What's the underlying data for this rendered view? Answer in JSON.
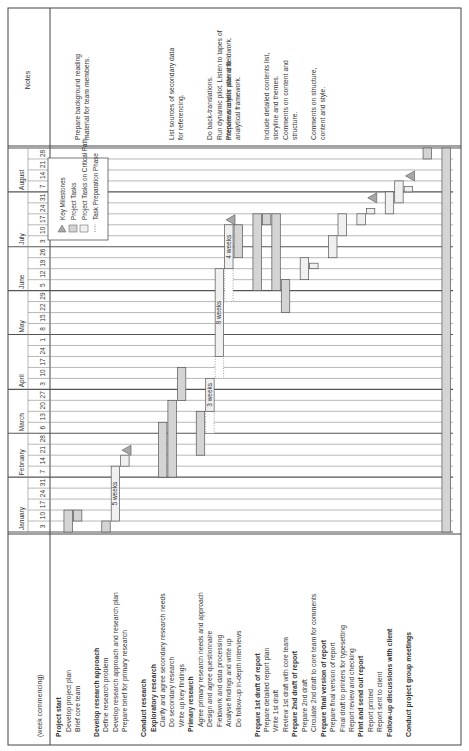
{
  "header": {
    "week_label": "(week commencing)",
    "notes_label": "Notes"
  },
  "months": [
    {
      "name": "January",
      "weeks": [
        "3",
        "10",
        "17",
        "24",
        "31"
      ]
    },
    {
      "name": "February",
      "weeks": [
        "7",
        "14",
        "21",
        "28"
      ]
    },
    {
      "name": "March",
      "weeks": [
        "6",
        "13",
        "20",
        "27"
      ]
    },
    {
      "name": "April",
      "weeks": [
        "3",
        "10",
        "17",
        "24",
        "1"
      ]
    },
    {
      "name": "May",
      "weeks": [
        "8",
        "15",
        "22",
        "29"
      ]
    },
    {
      "name": "June",
      "weeks": [
        "5",
        "12",
        "19",
        "26"
      ]
    },
    {
      "name": "July",
      "weeks": [
        "3",
        "10",
        "17",
        "24",
        "31"
      ]
    },
    {
      "name": "August",
      "weeks": [
        "7",
        "14",
        "21",
        "28"
      ]
    }
  ],
  "legend": {
    "items": [
      {
        "icon": "milestone-triangle",
        "label": "Key Milestones"
      },
      {
        "icon": "task-bar",
        "label": "Project Tasks"
      },
      {
        "icon": "critical-path-bar",
        "label": "Project Tasks on Critical Path"
      },
      {
        "icon": "dotted-bar",
        "label": "Task Preparation Phase"
      }
    ]
  },
  "colors": {
    "task": "#d4d4d4",
    "critical": "#f0f0f0",
    "milestone": "#a8a8a8",
    "grid": "#555555",
    "border": "#444444"
  },
  "rows": [
    {
      "label": "Project start",
      "bold": true,
      "indent": 0
    },
    {
      "label": "Develop project plan",
      "bold": false,
      "indent": 1
    },
    {
      "label": "Brief core team",
      "bold": false,
      "indent": 1
    },
    {
      "label": "",
      "bold": false,
      "indent": 0,
      "spacer": true
    },
    {
      "label": "Develop research approach",
      "bold": true,
      "indent": 0
    },
    {
      "label": "Define research problem",
      "bold": false,
      "indent": 1
    },
    {
      "label": "Develop research approach and research plan",
      "bold": false,
      "indent": 1
    },
    {
      "label": "Prepare brief for primary research",
      "bold": false,
      "indent": 1
    },
    {
      "label": "",
      "bold": false,
      "indent": 0,
      "spacer": true
    },
    {
      "label": "Conduct research",
      "bold": true,
      "indent": 0
    },
    {
      "label": "Exploratory research",
      "bold": true,
      "indent": 1
    },
    {
      "label": "Clarify and agree secondary research needs",
      "bold": false,
      "indent": 2
    },
    {
      "label": "Do secondary research",
      "bold": false,
      "indent": 2
    },
    {
      "label": "Write up key findings",
      "bold": false,
      "indent": 2
    },
    {
      "label": "Primary research",
      "bold": true,
      "indent": 1
    },
    {
      "label": "Agree primary research needs and approach",
      "bold": false,
      "indent": 2
    },
    {
      "label": "Design and agree questionnaire",
      "bold": false,
      "indent": 2
    },
    {
      "label": "Fieldwork and data processing",
      "bold": false,
      "indent": 2
    },
    {
      "label": "Analyse findings and write up",
      "bold": false,
      "indent": 2
    },
    {
      "label": "Do follow-up in-depth interviews",
      "bold": false,
      "indent": 2
    },
    {
      "label": "",
      "bold": false,
      "indent": 0,
      "spacer": true
    },
    {
      "label": "Prepare 1st draft of report",
      "bold": true,
      "indent": 0
    },
    {
      "label": "Prepare detailed report plan",
      "bold": false,
      "indent": 1
    },
    {
      "label": "Write 1st draft",
      "bold": false,
      "indent": 1
    },
    {
      "label": "Review 1st draft with core team",
      "bold": false,
      "indent": 1
    },
    {
      "label": "Prepare 2nd draft of report",
      "bold": true,
      "indent": 0
    },
    {
      "label": "Prepare 2nd draft",
      "bold": false,
      "indent": 1
    },
    {
      "label": "Circulate 2nd draft to core team for comments",
      "bold": false,
      "indent": 1
    },
    {
      "label": "Prepare final version of report",
      "bold": true,
      "indent": 0
    },
    {
      "label": "Prepare final version of report",
      "bold": false,
      "indent": 1
    },
    {
      "label": "Final draft to printers for typesetting",
      "bold": false,
      "indent": 1
    },
    {
      "label": "Report review and checking",
      "bold": false,
      "indent": 1
    },
    {
      "label": "Print and send out report",
      "bold": true,
      "indent": 0
    },
    {
      "label": "Report printed",
      "bold": false,
      "indent": 1
    },
    {
      "label": "Report sent to client",
      "bold": false,
      "indent": 1
    },
    {
      "label": "Follow-up discussions with client",
      "bold": true,
      "indent": 0
    },
    {
      "label": "",
      "bold": false,
      "indent": 0,
      "spacer": true
    },
    {
      "label": "Conduct project group meetings",
      "bold": true,
      "indent": 0
    }
  ],
  "notes": [
    {
      "row": 2,
      "lines": [
        "Prepare background reading",
        "material for team members."
      ]
    },
    {
      "row": 12,
      "lines": [
        "List sources of secondary data",
        "for referencing."
      ]
    },
    {
      "row": 16,
      "lines": [
        "Do back-translations."
      ]
    },
    {
      "row": 17,
      "lines": [
        "Run dynamic pilot. Listen to tapes of",
        "interviews and/or attend fieldwork."
      ]
    },
    {
      "row": 18,
      "lines": [
        "Prepare analysis plan and",
        "analytical framework."
      ]
    },
    {
      "row": 22,
      "lines": [
        "Include detailed contents list,",
        "storyline and themes."
      ]
    },
    {
      "row": 24,
      "lines": [
        "Comments on content and",
        "structure."
      ]
    },
    {
      "row": 27,
      "lines": [
        "Comments on structure,",
        "content and style."
      ]
    }
  ],
  "bars": [
    {
      "row": 1,
      "start": 0,
      "end": 2,
      "type": "task"
    },
    {
      "row": 2,
      "start": 1,
      "end": 2,
      "type": "task"
    },
    {
      "row": 5,
      "start": 0,
      "end": 1,
      "type": "task"
    },
    {
      "row": 6,
      "start": 1,
      "end": 6,
      "type": "critical",
      "label": "5 weeks"
    },
    {
      "row": 7,
      "start": 6,
      "end": 7,
      "type": "critical"
    },
    {
      "row": 11,
      "start": 5,
      "end": 10,
      "type": "task"
    },
    {
      "row": 12,
      "start": 5,
      "end": 12,
      "type": "task"
    },
    {
      "row": 13,
      "start": 12,
      "end": 15,
      "type": "task"
    },
    {
      "row": 15,
      "start": 7,
      "end": 11,
      "type": "task"
    },
    {
      "row": 16,
      "start": 9,
      "end": 11,
      "type": "prep"
    },
    {
      "row": 16,
      "start": 11,
      "end": 14,
      "type": "critical",
      "label": "3 weeks"
    },
    {
      "row": 17,
      "start": 14,
      "end": 16,
      "type": "prep"
    },
    {
      "row": 17,
      "start": 16,
      "end": 24,
      "type": "critical",
      "label": "8 weeks"
    },
    {
      "row": 18,
      "start": 21,
      "end": 24,
      "type": "prep"
    },
    {
      "row": 18,
      "start": 24,
      "end": 28,
      "type": "critical",
      "label": "4 weeks"
    },
    {
      "row": 19,
      "start": 25,
      "end": 28,
      "type": "task"
    },
    {
      "row": 21,
      "start": 22,
      "end": 29,
      "type": "task"
    },
    {
      "row": 22,
      "start": 28,
      "end": 29,
      "type": "task"
    },
    {
      "row": 23,
      "start": 22,
      "end": 29,
      "type": "task"
    },
    {
      "row": 24,
      "start": 20,
      "end": 23,
      "type": "task"
    },
    {
      "row": 26,
      "start": 23,
      "end": 25,
      "type": "critical"
    },
    {
      "row": 27,
      "start": 24,
      "end": 24.5,
      "type": "critical"
    },
    {
      "row": 29,
      "start": 25,
      "end": 27,
      "type": "critical"
    },
    {
      "row": 30,
      "start": 27,
      "end": 29,
      "type": "critical"
    },
    {
      "row": 32,
      "start": 28,
      "end": 29,
      "type": "critical"
    },
    {
      "row": 33,
      "start": 29,
      "end": 29.5,
      "type": "critical"
    },
    {
      "row": 35,
      "start": 29,
      "end": 31,
      "type": "critical"
    },
    {
      "row": 36,
      "start": 30,
      "end": 32,
      "type": "critical"
    },
    {
      "row": 37,
      "start": 31,
      "end": 31.5,
      "type": "critical"
    },
    {
      "row": 39,
      "start": 34,
      "end": 35,
      "type": "task"
    },
    {
      "row": 41,
      "start": 0,
      "end": 35,
      "type": "task"
    }
  ],
  "milestones": [
    {
      "row": 7,
      "week": 7
    },
    {
      "row": 18,
      "week": 28
    },
    {
      "row": 33,
      "week": 30
    },
    {
      "row": 37,
      "week": 32
    }
  ]
}
